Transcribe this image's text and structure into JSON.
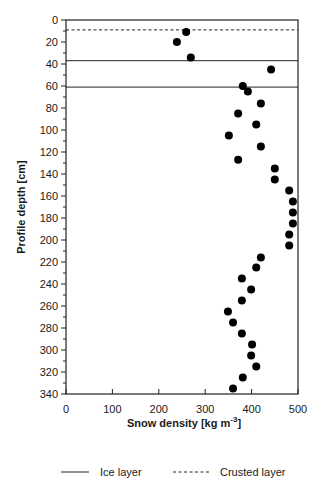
{
  "chart_data": {
    "type": "scatter",
    "title": "",
    "xlabel": "Snow density [kg m-3]",
    "xlabel_main": "Snow density [kg m",
    "xlabel_sup": "-3",
    "xlabel_end": "]",
    "ylabel": "Profile depth [cm]",
    "xlim": [
      0,
      500
    ],
    "ylim": [
      0,
      340
    ],
    "y_inverted": true,
    "grid": false,
    "x_ticks": [
      0,
      100,
      200,
      300,
      400,
      500
    ],
    "y_ticks": [
      0,
      20,
      40,
      60,
      80,
      100,
      120,
      140,
      160,
      180,
      200,
      220,
      240,
      260,
      280,
      300,
      320,
      340
    ],
    "series": [
      {
        "name": "Snow density",
        "marker": "filled-circle",
        "color": "#000000",
        "points": [
          {
            "x": 259,
            "y": 11
          },
          {
            "x": 239,
            "y": 20
          },
          {
            "x": 269,
            "y": 34
          },
          {
            "x": 442,
            "y": 45
          },
          {
            "x": 381,
            "y": 60
          },
          {
            "x": 392,
            "y": 65
          },
          {
            "x": 420,
            "y": 76
          },
          {
            "x": 371,
            "y": 85
          },
          {
            "x": 410,
            "y": 95
          },
          {
            "x": 351,
            "y": 105
          },
          {
            "x": 420,
            "y": 115
          },
          {
            "x": 371,
            "y": 127
          },
          {
            "x": 450,
            "y": 135
          },
          {
            "x": 450,
            "y": 145
          },
          {
            "x": 481,
            "y": 155
          },
          {
            "x": 489,
            "y": 165
          },
          {
            "x": 489,
            "y": 175
          },
          {
            "x": 489,
            "y": 185
          },
          {
            "x": 481,
            "y": 195
          },
          {
            "x": 481,
            "y": 205
          },
          {
            "x": 420,
            "y": 216
          },
          {
            "x": 410,
            "y": 225
          },
          {
            "x": 379,
            "y": 235
          },
          {
            "x": 399,
            "y": 245
          },
          {
            "x": 379,
            "y": 255
          },
          {
            "x": 349,
            "y": 265
          },
          {
            "x": 360,
            "y": 275
          },
          {
            "x": 379,
            "y": 285
          },
          {
            "x": 401,
            "y": 295
          },
          {
            "x": 399,
            "y": 305
          },
          {
            "x": 410,
            "y": 315
          },
          {
            "x": 381,
            "y": 325
          },
          {
            "x": 360,
            "y": 335
          }
        ]
      }
    ],
    "reference_lines": [
      {
        "type": "crusted",
        "y": 9,
        "style": "dashed"
      },
      {
        "type": "ice",
        "y": 37,
        "style": "solid"
      },
      {
        "type": "ice",
        "y": 61,
        "style": "solid"
      }
    ],
    "legend": {
      "position": "bottom",
      "entries": [
        {
          "label": "Ice layer",
          "style": "solid"
        },
        {
          "label": "Crusted layer",
          "style": "dashed"
        }
      ]
    }
  }
}
